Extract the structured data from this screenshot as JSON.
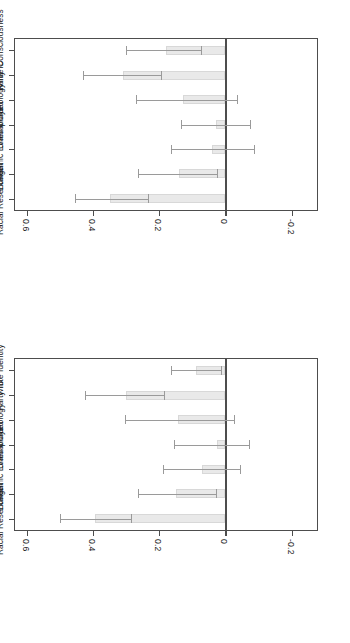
{
  "figure": {
    "orientation": "rotated-90",
    "bar_fill_color": "#e9e9e9",
    "bar_border_color": "#d8d8d8",
    "axis_color": "#4d4d4d",
    "whisker_color": "#9a9a9a"
  },
  "chart_data": [
    {
      "type": "bar",
      "panel": "top",
      "title": "",
      "xlabel": "",
      "ylabel": "",
      "ylim": [
        -0.28,
        0.64
      ],
      "grid": false,
      "legend": false,
      "axis_ticks": [
        "-0.2",
        "0",
        "0.2",
        "0.4",
        "0.6"
      ],
      "axis_tick_values": [
        -0.2,
        0,
        0.2,
        0.4,
        0.6
      ],
      "categories": [
        "White Consciousness",
        "Party ID",
        "Ideology",
        "Unemployed",
        "Negative National\nEconomic Evaluations",
        "Age",
        "Racial Resentment"
      ],
      "values": [
        0.18,
        0.31,
        0.13,
        0.03,
        0.04,
        0.14,
        0.35
      ],
      "ci_low": [
        0.075,
        0.195,
        -0.035,
        -0.075,
        -0.085,
        0.025,
        0.235
      ],
      "ci_high": [
        0.3,
        0.43,
        0.27,
        0.135,
        0.165,
        0.265,
        0.455
      ]
    },
    {
      "type": "bar",
      "panel": "bottom",
      "title": "",
      "xlabel": "",
      "ylabel": "",
      "ylim": [
        -0.28,
        0.64
      ],
      "grid": false,
      "legend": false,
      "axis_ticks": [
        "-0.2",
        "0",
        "0.2",
        "0.4",
        "0.6"
      ],
      "axis_tick_values": [
        -0.2,
        0,
        0.2,
        0.4,
        0.6
      ],
      "categories": [
        "White Identity",
        "Party ID",
        "Ideology",
        "Unemployed",
        "Negative National\nEconomic Evaluations",
        "Age",
        "Racial Resentment"
      ],
      "values": [
        0.09,
        0.3,
        0.145,
        0.025,
        0.07,
        0.15,
        0.395
      ],
      "ci_low": [
        0.015,
        0.185,
        -0.025,
        -0.07,
        -0.045,
        0.03,
        0.285
      ],
      "ci_high": [
        0.165,
        0.425,
        0.305,
        0.155,
        0.19,
        0.265,
        0.5
      ]
    }
  ]
}
